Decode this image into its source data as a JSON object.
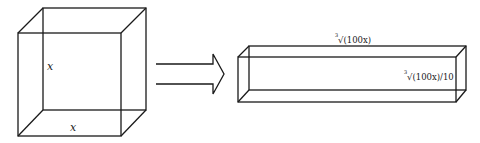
{
  "diagram": {
    "cube": {
      "height_label": "x",
      "width_label": "x"
    },
    "arrow": {
      "type": "double-line-arrow",
      "direction": "right"
    },
    "prism": {
      "length_label": {
        "root_index": "3",
        "text": "√(100x)"
      },
      "side_label": {
        "root_index": "3",
        "text": "√(100x)/10"
      }
    }
  }
}
